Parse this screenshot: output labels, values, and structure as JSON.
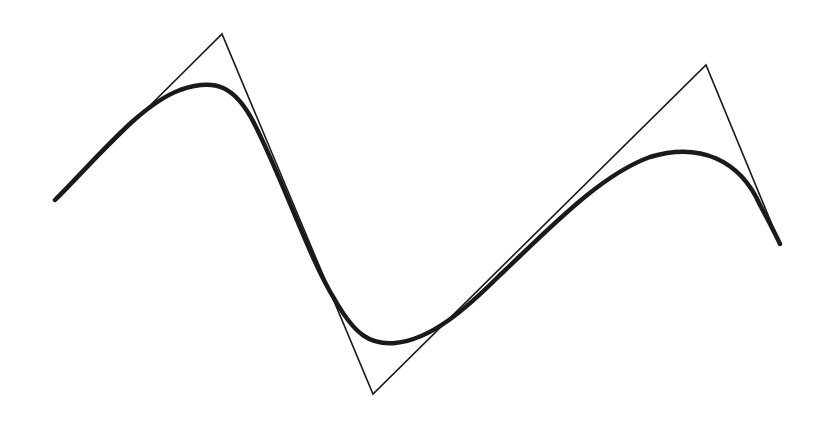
{
  "diagram": {
    "type": "spline-with-control-polygon",
    "width": 827,
    "height": 428,
    "background": "#ffffff",
    "control_polygon": {
      "stroke": "#1a1a1a",
      "stroke_width": 1.6,
      "points": [
        [
          55,
          200
        ],
        [
          222,
          34
        ],
        [
          373,
          394
        ],
        [
          706,
          65
        ],
        [
          780,
          244
        ]
      ]
    },
    "curve": {
      "stroke": "#1a1a1a",
      "stroke_width": 4.5,
      "path": "M55,200 C100,155 140,105 180,90 C215,78 235,85 255,125 C285,185 310,260 335,300 C355,335 370,345 395,343 C430,340 465,310 500,275 C550,228 600,175 650,157 C700,142 740,160 760,205 C768,220 775,233 780,244"
    }
  }
}
